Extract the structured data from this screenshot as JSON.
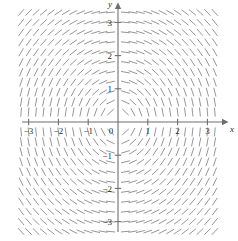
{
  "chart_data": {
    "type": "scatter",
    "title": "",
    "subtitle": "",
    "xlabel": "x",
    "ylabel": "y",
    "xlim": [
      -3.5,
      3.5
    ],
    "ylim": [
      -3.5,
      3.5
    ],
    "grid": false,
    "legend": null,
    "annotations": [],
    "x_ticks": [
      -3,
      -2,
      -1,
      0,
      1,
      2,
      3
    ],
    "x_tick_labels": [
      "−3",
      "−2",
      "−1",
      "0",
      "1",
      "2",
      "3"
    ],
    "y_ticks": [
      -3,
      -2,
      -1,
      1,
      2,
      3
    ],
    "y_tick_labels": [
      "−3",
      "−2",
      "−1",
      "1",
      "2",
      "3"
    ],
    "origin_label": "0",
    "slope_formula": "-x/y",
    "sample_x_start": -3.25,
    "sample_x_end": 3.25,
    "sample_x_step": 0.25,
    "sample_y_start": -3.3,
    "sample_y_end": 3.3,
    "sample_y_step": 0.3,
    "segment_length_px": 9,
    "colors": {
      "axis": "#6e6e6e",
      "slope_mark": "#8a8a8a",
      "tick_label": "#2b2b2b",
      "background": "#ffffff"
    },
    "axis_geometry": {
      "origin_px": [
        118,
        122
      ],
      "unit_px_x": 29.8,
      "unit_px_y": 33.2,
      "x_axis_y_px": 122,
      "y_axis_x_px": 118,
      "x_axis_left_px": 22,
      "x_axis_right_px": 222,
      "y_axis_top_px": 9,
      "y_axis_bottom_px": 232
    }
  },
  "figure": {
    "x_axis_name": "x",
    "y_axis_name": "y"
  }
}
